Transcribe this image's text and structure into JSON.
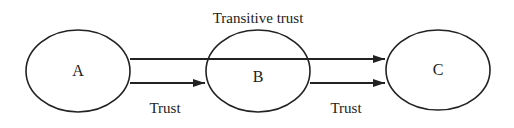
{
  "diagram": {
    "nodes": [
      {
        "id": "A",
        "label": "A",
        "cx": 78,
        "cy": 71
      },
      {
        "id": "B",
        "label": "B",
        "cx": 258,
        "cy": 71
      },
      {
        "id": "C",
        "label": "C",
        "cx": 438,
        "cy": 70
      }
    ],
    "edges": [
      {
        "from": "A",
        "to": "B",
        "label": "Trust"
      },
      {
        "from": "B",
        "to": "C",
        "label": "Trust"
      },
      {
        "from": "A",
        "to": "C",
        "label": "Transitive trust"
      }
    ],
    "colors": {
      "stroke": "#222222",
      "background": "#ffffff"
    }
  }
}
